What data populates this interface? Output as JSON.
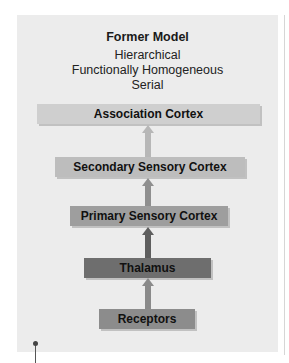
{
  "diagram": {
    "title": "Former Model",
    "properties": [
      "Hierarchical",
      "Functionally Homogeneous",
      "Serial"
    ],
    "levels": [
      {
        "label": "Association Cortex",
        "color": "#cfcfcf"
      },
      {
        "label": "Secondary Sensory Cortex",
        "color": "#bdbdbd"
      },
      {
        "label": "Primary Sensory Cortex",
        "color": "#9e9e9e"
      },
      {
        "label": "Thalamus",
        "color": "#6e6e6e"
      },
      {
        "label": "Receptors",
        "color": "#8c8c8c"
      }
    ],
    "arrows": [
      {
        "from": "Secondary Sensory Cortex",
        "to": "Association Cortex",
        "color": "#b7b7b7"
      },
      {
        "from": "Primary Sensory Cortex",
        "to": "Secondary Sensory Cortex",
        "color": "#8f8f8f"
      },
      {
        "from": "Thalamus",
        "to": "Primary Sensory Cortex",
        "color": "#5e5e5e"
      },
      {
        "from": "Receptors",
        "to": "Thalamus",
        "color": "#8a8a8a"
      }
    ]
  }
}
